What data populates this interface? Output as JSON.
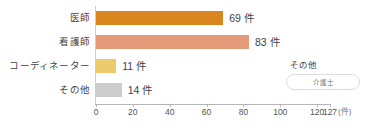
{
  "chart_data": {
    "type": "bar",
    "orientation": "horizontal",
    "title": "",
    "xlabel": "(件)",
    "ylabel": "",
    "xlim": [
      0,
      127
    ],
    "grid": false,
    "categories": [
      "医師",
      "看護師",
      "コーディネーター",
      "その他"
    ],
    "values": [
      69,
      83,
      11,
      14
    ],
    "value_labels": [
      "69 件",
      "83 件",
      "11 件",
      "14 件"
    ],
    "bar_colors": [
      "#D9861F",
      "#E59A7A",
      "#EBCB6B",
      "#CCCCCC"
    ],
    "ticks": [
      {
        "value": 0,
        "label": "0"
      },
      {
        "value": 20,
        "label": "20"
      },
      {
        "value": 40,
        "label": "40"
      },
      {
        "value": 60,
        "label": "60"
      },
      {
        "value": 80,
        "label": "80"
      },
      {
        "value": 100,
        "label": "100"
      },
      {
        "value": 120,
        "label": "120"
      },
      {
        "value": 127,
        "label": "127"
      }
    ],
    "unit_label": "(件)",
    "annotation": {
      "title": "その他",
      "items": [
        "介護士"
      ]
    }
  }
}
